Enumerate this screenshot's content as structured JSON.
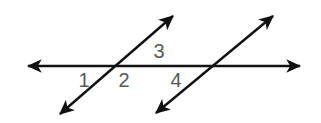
{
  "figure": {
    "type": "geometry-diagram",
    "background_color": "#ffffff",
    "line_color": "#111111",
    "label_color": "#58585a",
    "stroke_width": 2.4,
    "width": 321,
    "height": 123,
    "lines": [
      {
        "name": "horizontal-line",
        "x1": 28,
        "y1": 66,
        "x2": 300,
        "y2": 66,
        "arrow_start": true,
        "arrow_end": true
      },
      {
        "name": "transversal-left",
        "x1": 60,
        "y1": 114,
        "x2": 173,
        "y2": 16,
        "arrow_start": true,
        "arrow_end": true
      },
      {
        "name": "transversal-right",
        "x1": 156,
        "y1": 113,
        "x2": 273,
        "y2": 16,
        "arrow_start": true,
        "arrow_end": true
      }
    ],
    "intersections": [
      {
        "name": "intersection-left",
        "x": 113,
        "y": 66
      },
      {
        "name": "intersection-right",
        "x": 213,
        "y": 66
      }
    ],
    "labels": [
      {
        "name": "angle-label-1",
        "text": "1",
        "x": 84,
        "y": 87
      },
      {
        "name": "angle-label-2",
        "text": "2",
        "x": 124,
        "y": 87
      },
      {
        "name": "angle-label-3",
        "text": "3",
        "x": 159,
        "y": 58
      },
      {
        "name": "angle-label-4",
        "text": "4",
        "x": 176,
        "y": 87
      }
    ]
  }
}
